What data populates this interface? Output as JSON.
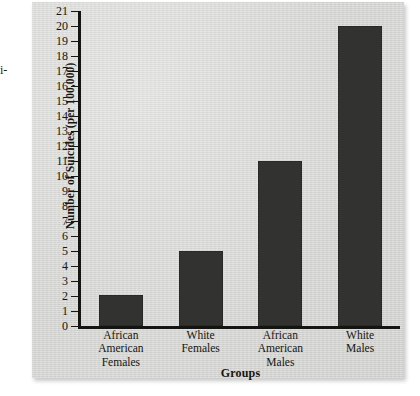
{
  "margin_text": "i-",
  "chart_data": {
    "type": "bar",
    "title": "",
    "xlabel": "Groups",
    "ylabel": "Number of Suicides (per 100,000)",
    "categories": [
      "African American Females",
      "White Females",
      "African American Males",
      "White Males"
    ],
    "category_lines": [
      [
        "African American",
        "Females"
      ],
      [
        "White",
        "Females"
      ],
      [
        "African American",
        "Males"
      ],
      [
        "White",
        "Males"
      ]
    ],
    "values": [
      2.1,
      5,
      11,
      20
    ],
    "ylim": [
      0,
      21
    ],
    "ytick_step": 1,
    "yticks": [
      21,
      20,
      19,
      18,
      17,
      16,
      15,
      14,
      13,
      12,
      11,
      10,
      9,
      8,
      7,
      6,
      5,
      4,
      3,
      2,
      1,
      0
    ],
    "grid": false,
    "legend": false,
    "bar_color": "#323230",
    "panel_color": "#d3d3d1",
    "axis_color": "#141410"
  }
}
